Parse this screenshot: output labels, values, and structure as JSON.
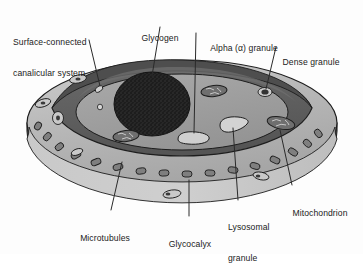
{
  "figure": {
    "style": "grayscale line drawing with stipple shading"
  },
  "labels": [
    {
      "id": "surface-connected-canalicular-system",
      "text": "Surface-connected\ncanalicular system",
      "line1": "Surface-connected",
      "line2": "canalicular system",
      "align": "left"
    },
    {
      "id": "glycogen",
      "text": "Glycogen",
      "line1": "Glycogen",
      "line2": "",
      "align": "center"
    },
    {
      "id": "alpha-granule",
      "text": "Alpha (α) granule",
      "line1": "Alpha (α) granule",
      "line2": "",
      "align": "center"
    },
    {
      "id": "dense-granule",
      "text": "Dense granule",
      "line1": "Dense granule",
      "line2": "",
      "align": "center"
    },
    {
      "id": "mitochondrion",
      "text": "Mitochondrion",
      "line1": "Mitochondrion",
      "line2": "",
      "align": "center"
    },
    {
      "id": "lysosomal-granule",
      "text": "Lysosomal\ngranule",
      "line1": "Lysosomal",
      "line2": "granule",
      "align": "left"
    },
    {
      "id": "glycocalyx",
      "text": "Glycocalyx",
      "line1": "Glycocalyx",
      "line2": "",
      "align": "center"
    },
    {
      "id": "microtubules",
      "text": "Microtubules",
      "line1": "Microtubules",
      "line2": "",
      "align": "center"
    }
  ],
  "colors": {
    "background": "#fdfdfd",
    "outline": "#1d1d1d",
    "leader_line": "#2a2a2a",
    "top_surface": "#b9b9b9",
    "top_surface_highlight": "#c9c9c9",
    "front_wall_dark": "#4a4a4a",
    "cut_face_dark": "#3e3e3e",
    "cytoplasm_ring": "#5e5e5e",
    "inner_matrix": "#9d9d9d",
    "microtubule_band": "#c4c4c4",
    "microtubule_fill": "#808080",
    "glycogen_mass": "#242424",
    "granule_light": "#d0d0d0",
    "dense_granule": "#3a3a3a",
    "mitochondrion_fill": "#6d6d6d",
    "text": "#1b1b1b"
  }
}
